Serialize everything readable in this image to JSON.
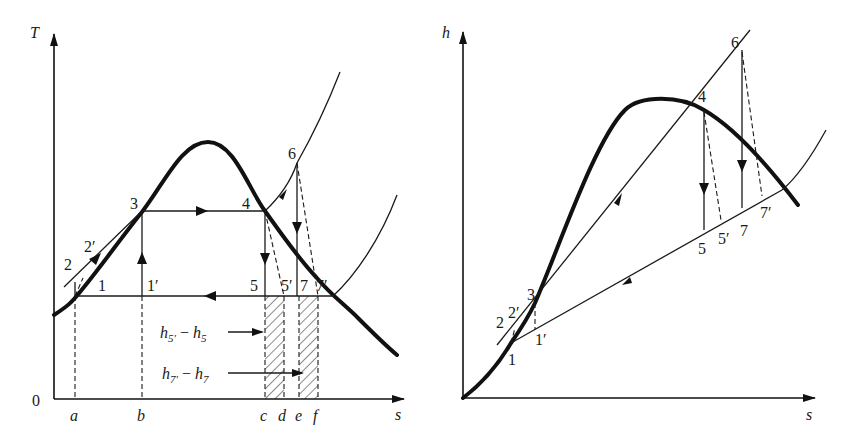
{
  "figure": {
    "left_diagram": {
      "type": "T-s diagram",
      "y_axis_label": "T",
      "x_axis_label": "s",
      "origin_label": "0",
      "x_ticks": [
        "a",
        "b",
        "c",
        "d",
        "e",
        "f"
      ],
      "state_points": [
        "1",
        "1′",
        "2",
        "2′",
        "3",
        "4",
        "5",
        "5′",
        "6",
        "7",
        "7′"
      ],
      "annotations": [
        {
          "id": "h5",
          "base": "h",
          "sub1": "5′",
          "minus": " − ",
          "base2": "h",
          "sub2": "5"
        },
        {
          "id": "h7",
          "base": "h",
          "sub1": "7′",
          "minus": " − ",
          "base2": "h",
          "sub2": "7"
        }
      ]
    },
    "right_diagram": {
      "type": "h-s diagram",
      "y_axis_label": "h",
      "x_axis_label": "s",
      "state_points": [
        "1",
        "1′",
        "2",
        "2′",
        "3",
        "4",
        "5",
        "5′",
        "6",
        "7",
        "7′"
      ]
    },
    "colors": {
      "ink": "#1a1a1a",
      "background": "#ffffff"
    }
  }
}
